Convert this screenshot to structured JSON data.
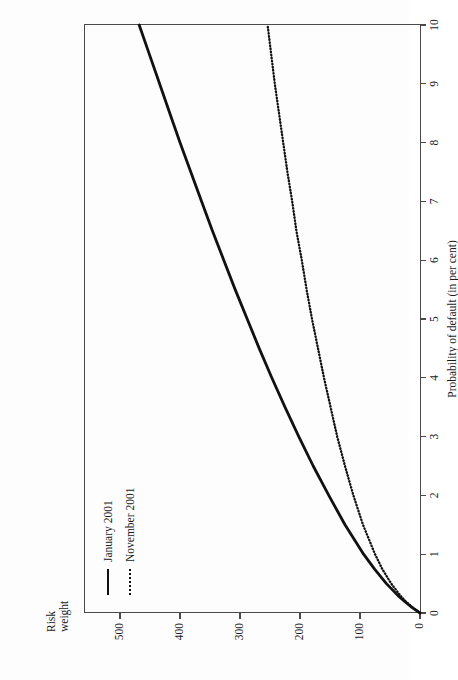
{
  "chart_data": {
    "type": "line",
    "title": "",
    "orientation": "page-rotated-90ccw",
    "xlabel": "Probability of default (in per cent)",
    "ylabel": "Risk weight",
    "ylabel_line1": "Risk",
    "ylabel_line2": "weight",
    "xlim": [
      0,
      10
    ],
    "ylim": [
      0,
      560
    ],
    "xticks": [
      "0",
      "1",
      "2",
      "3",
      "4",
      "5",
      "6",
      "7",
      "8",
      "9",
      "10"
    ],
    "xtick_values": [
      0,
      1,
      2,
      3,
      4,
      5,
      6,
      7,
      8,
      9,
      10
    ],
    "yticks": [
      "0",
      "100",
      "200",
      "300",
      "400",
      "500"
    ],
    "ytick_values": [
      0,
      100,
      200,
      300,
      400,
      500
    ],
    "grid": false,
    "legend_position": "top-left-inside",
    "series": [
      {
        "name": "January 2001",
        "style": "solid",
        "color": "#111111",
        "x": [
          0,
          0.1,
          0.2,
          0.3,
          0.5,
          0.75,
          1,
          1.5,
          2,
          2.5,
          3,
          3.5,
          4,
          4.5,
          5,
          5.5,
          6,
          6.5,
          7,
          7.5,
          8,
          8.5,
          9,
          9.5,
          10
        ],
        "values": [
          0,
          14,
          26,
          37,
          56,
          76,
          94,
          125,
          152,
          178,
          202,
          225,
          247,
          268,
          288,
          308,
          327,
          346,
          364,
          382,
          400,
          417,
          434,
          451,
          468
        ]
      },
      {
        "name": "November 2001",
        "style": "dotted",
        "color": "#111111",
        "x": [
          0,
          0.1,
          0.2,
          0.3,
          0.5,
          0.75,
          1,
          1.5,
          2,
          2.5,
          3,
          3.5,
          4,
          4.5,
          5,
          5.5,
          6,
          6.5,
          7,
          7.5,
          8,
          8.5,
          9,
          9.5,
          10
        ],
        "values": [
          0,
          13,
          24,
          33,
          48,
          63,
          75,
          95,
          111,
          125,
          138,
          149,
          160,
          170,
          180,
          189,
          197,
          206,
          213,
          221,
          228,
          235,
          242,
          248,
          254
        ]
      }
    ],
    "legend": [
      "January 2001",
      "November 2001"
    ]
  },
  "legend": {
    "items": [
      {
        "label": "January 2001",
        "style": "solid"
      },
      {
        "label": "November 2001",
        "style": "dotted"
      }
    ]
  },
  "axes": {
    "x_title": "Probability of default (in per cent)",
    "y_title_line1": "Risk",
    "y_title_line2": "weight"
  }
}
